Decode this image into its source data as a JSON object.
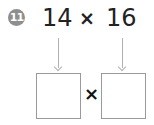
{
  "problem": {
    "number": "11",
    "operand_a": "14",
    "operator": "×",
    "operand_b": "16",
    "answer_operator": "×",
    "answer_box_a": "",
    "answer_box_b": ""
  },
  "colors": {
    "badge": "#8e8e8e",
    "text": "#222222",
    "arrow": "#b0b0b0",
    "box_border": "#9a9a9a"
  }
}
